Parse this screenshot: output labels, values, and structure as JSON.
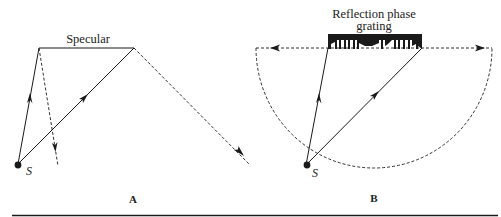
{
  "figure": {
    "panel_a": {
      "label": "A",
      "surface_label": "Specular",
      "source_label": "S"
    },
    "panel_b": {
      "label": "B",
      "surface_label_line1": "Reflection phase",
      "surface_label_line2": "grating",
      "source_label": "S"
    },
    "colors": {
      "ink": "#1a1a1a",
      "background": "#ffffff"
    }
  }
}
